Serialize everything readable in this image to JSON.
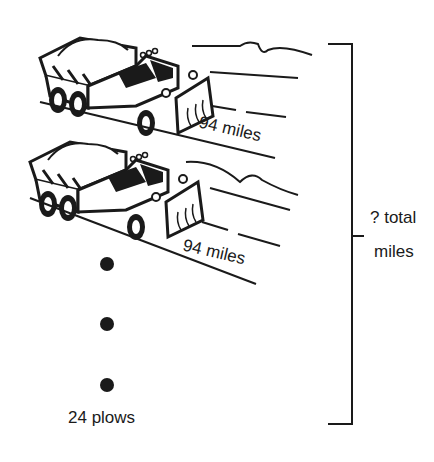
{
  "diagram": {
    "plows": [
      {
        "label": "94 miles"
      },
      {
        "label": "94 miles"
      }
    ],
    "count_label": "24 plows",
    "total_label_line1": "? total",
    "total_label_line2": "miles",
    "colors": {
      "ink": "#1a1a1a",
      "background": "#ffffff"
    }
  }
}
